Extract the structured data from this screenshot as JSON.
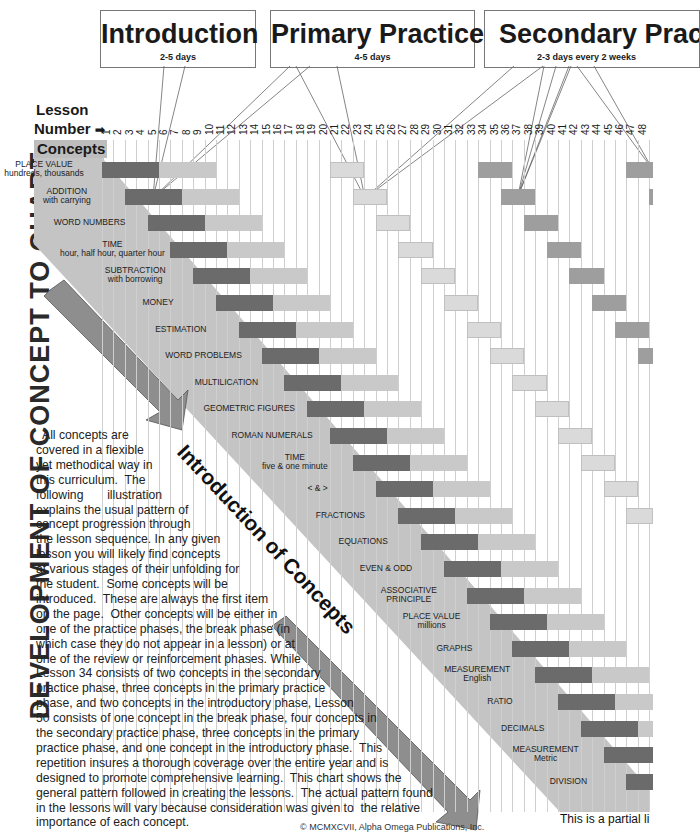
{
  "vertical_title": "DEVELOPMENT OF CONCEPT TO CHART",
  "phases": [
    {
      "title": "Introduction",
      "subtitle": "2-5 days"
    },
    {
      "title": "Primary Practice",
      "subtitle": "4-5 days"
    },
    {
      "title": "Secondary Practice",
      "subtitle": "2-3 days every 2 weeks"
    }
  ],
  "axis": {
    "lesson_label": "Lesson",
    "number_label": "Number",
    "arrow_icon": "➡",
    "concepts_label": "Concepts"
  },
  "lesson_numbers": [
    "1",
    "2",
    "3",
    "4",
    "5",
    "6",
    "7",
    "8",
    "9",
    "10",
    "11",
    "12",
    "13",
    "14",
    "15",
    "16",
    "17",
    "18",
    "19",
    "20",
    "21",
    "22",
    "23",
    "24",
    "25",
    "26",
    "27",
    "28",
    "29",
    "30",
    "31",
    "32",
    "33",
    "34",
    "35",
    "36",
    "37",
    "38",
    "39",
    "40",
    "41",
    "42",
    "43",
    "44",
    "45",
    "46",
    "47",
    "48"
  ],
  "concepts": [
    {
      "name": "PLACE VALUE",
      "sub": "hundreds, thousands"
    },
    {
      "name": "ADDITION",
      "sub": "with carrying"
    },
    {
      "name": "WORD NUMBERS",
      "sub": ""
    },
    {
      "name": "TIME",
      "sub": "hour, half hour, quarter hour"
    },
    {
      "name": "SUBTRACTION",
      "sub": "with borrowing"
    },
    {
      "name": "MONEY",
      "sub": ""
    },
    {
      "name": "ESTIMATION",
      "sub": ""
    },
    {
      "name": "WORD PROBLEMS",
      "sub": ""
    },
    {
      "name": "MULTILICATION",
      "sub": ""
    },
    {
      "name": "GEOMETRIC FIGURES",
      "sub": ""
    },
    {
      "name": "ROMAN NUMERALS",
      "sub": ""
    },
    {
      "name": "TIME",
      "sub": "five & one minute"
    },
    {
      "name": "< & >",
      "sub": ""
    },
    {
      "name": "FRACTIONS",
      "sub": ""
    },
    {
      "name": "EQUATIONS",
      "sub": ""
    },
    {
      "name": "EVEN & ODD",
      "sub": ""
    },
    {
      "name": "ASSOCIATIVE",
      "sub": "PRINCIPLE"
    },
    {
      "name": "PLACE VALUE",
      "sub": "millions"
    },
    {
      "name": "GRAPHS",
      "sub": ""
    },
    {
      "name": "MEASUREMENT",
      "sub": "English"
    },
    {
      "name": "RATIO",
      "sub": ""
    },
    {
      "name": "DECIMALS",
      "sub": ""
    },
    {
      "name": "MEASUREMENT",
      "sub": "Metric"
    },
    {
      "name": "DIVISION",
      "sub": ""
    }
  ],
  "chart_data": {
    "type": "gantt",
    "title": "DEVELOPMENT OF CONCEPT TO CHART",
    "xlabel": "Lesson Number",
    "x_range": [
      1,
      48
    ],
    "phase_legend": [
      "Introduction (2-5 days)",
      "Primary Practice (4-5 days)",
      "Secondary Practice (2-3 days every 2 weeks)"
    ],
    "pattern": "Each concept starts 2 lessons after the previous; introduction 5 lessons (dark), primary practice 5 lessons (light), then secondary practice blocks of 3 lessons about every 2 weeks.",
    "rows": [
      {
        "concept": "PLACE VALUE hundreds, thousands",
        "intro": [
          1,
          5
        ],
        "primary": [
          6,
          10
        ],
        "secondary": [
          [
            21,
            23
          ],
          [
            34,
            36
          ],
          [
            47,
            49
          ]
        ]
      },
      {
        "concept": "ADDITION with carrying",
        "intro": [
          3,
          7
        ],
        "primary": [
          8,
          12
        ],
        "secondary": [
          [
            23,
            25
          ],
          [
            36,
            38
          ],
          [
            49,
            51
          ]
        ]
      },
      {
        "concept": "WORD NUMBERS",
        "intro": [
          5,
          9
        ],
        "primary": [
          10,
          14
        ],
        "secondary": [
          [
            25,
            27
          ],
          [
            38,
            40
          ]
        ]
      },
      {
        "concept": "TIME hour, half hour, quarter hour",
        "intro": [
          7,
          11
        ],
        "primary": [
          12,
          16
        ],
        "secondary": [
          [
            27,
            29
          ],
          [
            40,
            42
          ]
        ]
      },
      {
        "concept": "SUBTRACTION with borrowing",
        "intro": [
          9,
          13
        ],
        "primary": [
          14,
          18
        ],
        "secondary": [
          [
            29,
            31
          ],
          [
            42,
            44
          ]
        ]
      },
      {
        "concept": "MONEY",
        "intro": [
          11,
          15
        ],
        "primary": [
          16,
          20
        ],
        "secondary": [
          [
            31,
            33
          ],
          [
            44,
            46
          ]
        ]
      },
      {
        "concept": "ESTIMATION",
        "intro": [
          13,
          17
        ],
        "primary": [
          18,
          22
        ],
        "secondary": [
          [
            33,
            35
          ],
          [
            46,
            48
          ]
        ]
      },
      {
        "concept": "WORD PROBLEMS",
        "intro": [
          15,
          19
        ],
        "primary": [
          20,
          24
        ],
        "secondary": [
          [
            35,
            37
          ],
          [
            48,
            50
          ]
        ]
      },
      {
        "concept": "MULTILICATION",
        "intro": [
          17,
          21
        ],
        "primary": [
          22,
          26
        ],
        "secondary": [
          [
            37,
            39
          ]
        ]
      },
      {
        "concept": "GEOMETRIC FIGURES",
        "intro": [
          19,
          23
        ],
        "primary": [
          24,
          28
        ],
        "secondary": [
          [
            39,
            41
          ]
        ]
      },
      {
        "concept": "ROMAN NUMERALS",
        "intro": [
          21,
          25
        ],
        "primary": [
          26,
          30
        ],
        "secondary": [
          [
            41,
            43
          ]
        ]
      },
      {
        "concept": "TIME five & one minute",
        "intro": [
          23,
          27
        ],
        "primary": [
          28,
          32
        ],
        "secondary": [
          [
            43,
            45
          ]
        ]
      },
      {
        "concept": "< & >",
        "intro": [
          25,
          29
        ],
        "primary": [
          30,
          34
        ],
        "secondary": [
          [
            45,
            47
          ]
        ]
      },
      {
        "concept": "FRACTIONS",
        "intro": [
          27,
          31
        ],
        "primary": [
          32,
          36
        ],
        "secondary": [
          [
            47,
            49
          ]
        ]
      },
      {
        "concept": "EQUATIONS",
        "intro": [
          29,
          33
        ],
        "primary": [
          34,
          38
        ],
        "secondary": []
      },
      {
        "concept": "EVEN & ODD",
        "intro": [
          31,
          35
        ],
        "primary": [
          36,
          40
        ],
        "secondary": []
      },
      {
        "concept": "ASSOCIATIVE PRINCIPLE",
        "intro": [
          33,
          37
        ],
        "primary": [
          38,
          42
        ],
        "secondary": []
      },
      {
        "concept": "PLACE VALUE millions",
        "intro": [
          35,
          39
        ],
        "primary": [
          40,
          44
        ],
        "secondary": []
      },
      {
        "concept": "GRAPHS",
        "intro": [
          37,
          41
        ],
        "primary": [
          42,
          46
        ],
        "secondary": []
      },
      {
        "concept": "MEASUREMENT English",
        "intro": [
          39,
          43
        ],
        "primary": [
          44,
          48
        ],
        "secondary": []
      },
      {
        "concept": "RATIO",
        "intro": [
          41,
          45
        ],
        "primary": [
          46,
          50
        ],
        "secondary": []
      },
      {
        "concept": "DECIMALS",
        "intro": [
          43,
          47
        ],
        "primary": [
          48,
          52
        ],
        "secondary": []
      },
      {
        "concept": "MEASUREMENT Metric",
        "intro": [
          45,
          49
        ],
        "primary": [],
        "secondary": []
      },
      {
        "concept": "DIVISION",
        "intro": [
          47,
          51
        ],
        "primary": [],
        "secondary": []
      }
    ]
  },
  "diagonal_label": "Introduction of Concepts",
  "paragraph": [
    "All concepts are",
    "covered in a flexible",
    "yet methodical way in",
    "this curriculum.  The",
    "following       illustration",
    "explains the usual pattern of",
    "concept progression through",
    "the lesson sequence. In any given",
    "lesson you will likely find concepts",
    "at various stages of their unfolding for",
    "the student.  Some concepts will be",
    "introduced.  These are always the first item",
    "on the page.  Other concepts will be either in",
    "one of the practice phases, the break phase (in",
    "which case they do not appear in a lesson) or at",
    "one of the review or reinforcement phases. While",
    "Lesson 34 consists of two concepts in the secondary",
    "practice phase, three concepts in the primary practice",
    "phase, and two concepts in the introductory phase, Lesson",
    "50 consists of one concept in the break phase, four concepts in",
    "the secondary practice phase, three concepts in the primary",
    "practice phase, and one concept in the introductory phase.  This",
    "repetition insures a thorough coverage over the entire year and is",
    "designed to promote comprehensive learning.  This chart shows the",
    "general pattern followed in creating the lessons.  The actual pattern found",
    "in the lessons will vary because consideration was given to  the relative",
    "importance of each concept."
  ],
  "partial_note": "This is a partial li",
  "copyright": "© MCMXCVII, Alpha Omega Publications, Inc.",
  "colors": {
    "intro": "#6b6b6b",
    "primary": "#c9c9c9",
    "secondary": "#9e9e9e",
    "band": "#c4c4c4",
    "grid": "#cfcfcf"
  }
}
